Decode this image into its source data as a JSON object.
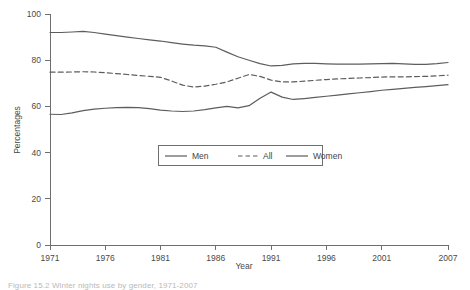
{
  "figure": {
    "caption": "Figure 15.2  Winter nights use by gender, 1971-2007"
  },
  "chart_data": {
    "type": "line",
    "title": "",
    "xlabel": "Year",
    "ylabel": "Percentages",
    "xlim": [
      1971,
      2007
    ],
    "ylim": [
      0,
      100
    ],
    "grid": false,
    "legend_position": "center",
    "xticks": [
      1971,
      1976,
      1981,
      1986,
      1991,
      1996,
      2001,
      2007
    ],
    "yticks": [
      0,
      20,
      40,
      60,
      80,
      100
    ],
    "x": [
      1971,
      1972,
      1973,
      1974,
      1975,
      1976,
      1977,
      1978,
      1979,
      1980,
      1981,
      1982,
      1983,
      1984,
      1985,
      1986,
      1987,
      1988,
      1989,
      1990,
      1991,
      1992,
      1993,
      1994,
      1995,
      1996,
      1997,
      1998,
      1999,
      2000,
      2001,
      2002,
      2003,
      2004,
      2005,
      2006,
      2007
    ],
    "series": [
      {
        "name": "Men",
        "style": "solid",
        "color": "#5d5d5d",
        "values": [
          92.0,
          92.0,
          92.2,
          92.5,
          92.0,
          91.3,
          90.6,
          90.0,
          89.4,
          88.8,
          88.3,
          87.6,
          87.0,
          86.5,
          86.2,
          85.6,
          83.5,
          81.5,
          80.0,
          78.5,
          77.5,
          77.8,
          78.4,
          78.6,
          78.6,
          78.4,
          78.3,
          78.3,
          78.3,
          78.4,
          78.5,
          78.6,
          78.4,
          78.2,
          78.2,
          78.5,
          79.0
        ]
      },
      {
        "name": "All",
        "style": "dashed",
        "color": "#5d5d5d",
        "values": [
          74.8,
          74.8,
          74.9,
          75.0,
          74.9,
          74.6,
          74.2,
          73.8,
          73.4,
          73.0,
          72.6,
          71.0,
          69.2,
          68.4,
          68.8,
          69.6,
          70.6,
          72.2,
          73.8,
          73.0,
          71.4,
          70.6,
          70.6,
          70.9,
          71.3,
          71.6,
          71.9,
          72.1,
          72.3,
          72.5,
          72.7,
          72.8,
          72.8,
          72.9,
          73.0,
          73.2,
          73.5
        ]
      },
      {
        "name": "Women",
        "style": "solid",
        "color": "#5d5d5d",
        "values": [
          56.6,
          56.5,
          57.2,
          58.2,
          58.8,
          59.2,
          59.5,
          59.6,
          59.5,
          59.0,
          58.4,
          58.0,
          57.8,
          58.0,
          58.6,
          59.4,
          60.0,
          59.4,
          60.3,
          63.5,
          66.2,
          64.0,
          63.0,
          63.4,
          63.9,
          64.4,
          64.9,
          65.4,
          65.9,
          66.4,
          67.0,
          67.4,
          67.8,
          68.2,
          68.6,
          69.0,
          69.4
        ]
      }
    ]
  }
}
